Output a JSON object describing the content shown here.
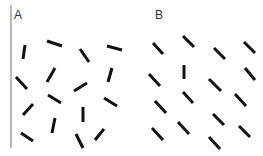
{
  "figure": {
    "width": 263,
    "height": 156,
    "colors": {
      "segment": "#111111",
      "axis": "#8a8a8a",
      "label": "#333333",
      "background": "#ffffff"
    },
    "divider": {
      "x1": 11,
      "y1": 5,
      "x2": 11,
      "y2": 148
    }
  },
  "panels": [
    {
      "label": "A",
      "label_pos": {
        "x": 14,
        "y": 19
      },
      "description": "Randomly oriented line segments",
      "segments": [
        {
          "x1": 25,
          "y1": 45,
          "x2": 23,
          "y2": 59
        },
        {
          "x1": 47,
          "y1": 41,
          "x2": 62,
          "y2": 46
        },
        {
          "x1": 80,
          "y1": 49,
          "x2": 89,
          "y2": 62
        },
        {
          "x1": 107,
          "y1": 46,
          "x2": 122,
          "y2": 50
        },
        {
          "x1": 16,
          "y1": 77,
          "x2": 27,
          "y2": 89
        },
        {
          "x1": 47,
          "y1": 82,
          "x2": 55,
          "y2": 68
        },
        {
          "x1": 74,
          "y1": 91,
          "x2": 87,
          "y2": 83
        },
        {
          "x1": 108,
          "y1": 82,
          "x2": 112,
          "y2": 68
        },
        {
          "x1": 23,
          "y1": 115,
          "x2": 33,
          "y2": 104
        },
        {
          "x1": 48,
          "y1": 95,
          "x2": 61,
          "y2": 103
        },
        {
          "x1": 83,
          "y1": 107,
          "x2": 83,
          "y2": 122
        },
        {
          "x1": 104,
          "y1": 98,
          "x2": 117,
          "y2": 106
        },
        {
          "x1": 21,
          "y1": 133,
          "x2": 33,
          "y2": 141
        },
        {
          "x1": 55,
          "y1": 118,
          "x2": 52,
          "y2": 133
        },
        {
          "x1": 76,
          "y1": 134,
          "x2": 83,
          "y2": 148
        },
        {
          "x1": 104,
          "y1": 129,
          "x2": 95,
          "y2": 140
        }
      ]
    },
    {
      "label": "B",
      "label_pos": {
        "x": 155,
        "y": 19
      },
      "description": "Uniformly oriented diagonal segments with one vertical odd-one-out",
      "segments": [
        {
          "x1": 153,
          "y1": 43,
          "x2": 163,
          "y2": 54
        },
        {
          "x1": 183,
          "y1": 36,
          "x2": 194,
          "y2": 47
        },
        {
          "x1": 214,
          "y1": 48,
          "x2": 225,
          "y2": 59
        },
        {
          "x1": 244,
          "y1": 42,
          "x2": 255,
          "y2": 53
        },
        {
          "x1": 149,
          "y1": 74,
          "x2": 160,
          "y2": 86
        },
        {
          "x1": 184,
          "y1": 65,
          "x2": 184,
          "y2": 79
        },
        {
          "x1": 209,
          "y1": 79,
          "x2": 221,
          "y2": 91
        },
        {
          "x1": 245,
          "y1": 68,
          "x2": 255,
          "y2": 80
        },
        {
          "x1": 155,
          "y1": 101,
          "x2": 166,
          "y2": 113
        },
        {
          "x1": 183,
          "y1": 92,
          "x2": 193,
          "y2": 103
        },
        {
          "x1": 235,
          "y1": 94,
          "x2": 246,
          "y2": 106
        },
        {
          "x1": 213,
          "y1": 114,
          "x2": 224,
          "y2": 125
        },
        {
          "x1": 152,
          "y1": 128,
          "x2": 163,
          "y2": 140
        },
        {
          "x1": 178,
          "y1": 122,
          "x2": 189,
          "y2": 134
        },
        {
          "x1": 239,
          "y1": 126,
          "x2": 250,
          "y2": 137
        },
        {
          "x1": 209,
          "y1": 137,
          "x2": 220,
          "y2": 149
        }
      ]
    }
  ]
}
